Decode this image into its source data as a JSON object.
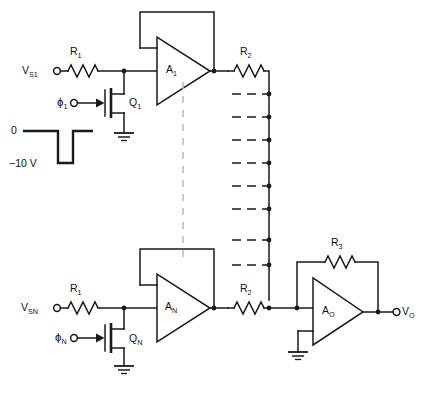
{
  "diagram": {
    "type": "analog-circuit-schematic"
  },
  "channel_top": {
    "source_label": "V",
    "source_sub": "S1",
    "input_resistor": "R",
    "input_resistor_sub": "1",
    "clock_label": "ϕ",
    "clock_sub": "1",
    "switch_label": "Q",
    "switch_sub": "1",
    "amp_label": "A",
    "amp_sub": "1",
    "feed_resistor": "R",
    "feed_resistor_sub": "2"
  },
  "channel_bottom": {
    "source_label": "V",
    "source_sub": "SN",
    "input_resistor": "R",
    "input_resistor_sub": "1",
    "clock_label": "ϕ",
    "clock_sub": "N",
    "switch_label": "Q",
    "switch_sub": "N",
    "amp_label": "A",
    "amp_sub": "N",
    "feed_resistor": "R",
    "feed_resistor_sub": "2"
  },
  "output_stage": {
    "feedback_resistor": "R",
    "feedback_resistor_sub": "3",
    "amp_label": "A",
    "amp_sub": "O",
    "output_label": "V",
    "output_sub": "O"
  },
  "waveform": {
    "high_level": "0",
    "low_level": "−10 V"
  },
  "bus": {
    "tap_count": 8
  },
  "colors": {
    "ink": "#1a1a1a",
    "background": "#ffffff",
    "divider": "#b9b9b9"
  }
}
